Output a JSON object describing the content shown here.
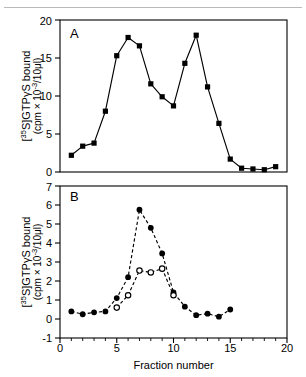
{
  "figure": {
    "panel_a_letter": "A",
    "panel_b_letter": "B",
    "x_axis_label": "Fraction number",
    "y_axis_label_line1": "[35S]GTPγS bound",
    "y_axis_label_line2": "(cpm × 10-3/10μl)",
    "y_axis_label_main": "[",
    "y_axis_sup_35": "35",
    "y_axis_label_mid": "S]GTPγS bound",
    "y_axis_sub_open": "(cpm × 10",
    "y_axis_sup_neg3": "-3",
    "y_axis_sub_close": "/10μl)"
  },
  "colors": {
    "ink": "#000000",
    "paper": "#ffffff",
    "rule": "#b9b9b9"
  },
  "axes": {
    "x_ticks_major": [
      "0",
      "5",
      "10",
      "15",
      "20"
    ],
    "panel_a_y_ticks": [
      "0",
      "5",
      "10",
      "15",
      "20"
    ],
    "panel_b_y_ticks": [
      "-1",
      "0",
      "1",
      "2",
      "3",
      "4",
      "5",
      "6",
      "7"
    ]
  },
  "chart_data": [
    {
      "type": "line",
      "panel": "A",
      "title": "A",
      "xlabel": "",
      "ylabel": "[35S]GTPγS bound (cpm × 10-3/10μl)",
      "xlim": [
        0,
        20
      ],
      "ylim": [
        0,
        20
      ],
      "xticks": [
        0,
        5,
        10,
        15,
        20
      ],
      "yticks": [
        0,
        5,
        10,
        15,
        20
      ],
      "minor_xticks": [
        1,
        2,
        3,
        4,
        6,
        7,
        8,
        9,
        11,
        12,
        13,
        14,
        16,
        17,
        18,
        19
      ],
      "grid": false,
      "legend": "none",
      "series": [
        {
          "name": "[35S]GTPγS bound",
          "marker": "filled-square",
          "linestyle": "solid",
          "x": [
            1,
            2,
            3,
            4,
            5,
            6,
            7,
            8,
            9,
            10,
            11,
            12,
            13,
            14,
            15,
            16,
            17,
            18,
            19
          ],
          "values": [
            2.2,
            3.4,
            3.8,
            8.0,
            15.3,
            17.7,
            16.6,
            11.6,
            9.9,
            8.7,
            14.3,
            18.0,
            11.2,
            6.4,
            1.7,
            0.5,
            0.4,
            0.3,
            0.7
          ]
        }
      ]
    },
    {
      "type": "line",
      "panel": "B",
      "title": "B",
      "xlabel": "Fraction number",
      "ylabel": "[35S]GTPγS bound (cpm × 10-3/10μl)",
      "xlim": [
        0,
        20
      ],
      "ylim": [
        -1,
        7
      ],
      "xticks": [
        0,
        5,
        10,
        15,
        20
      ],
      "yticks": [
        -1,
        0,
        1,
        2,
        3,
        4,
        5,
        6,
        7
      ],
      "minor_xticks": [
        1,
        2,
        3,
        4,
        6,
        7,
        8,
        9,
        11,
        12,
        13,
        14,
        16,
        17,
        18,
        19
      ],
      "grid": false,
      "legend": "none",
      "series": [
        {
          "name": "filled-circle series",
          "marker": "filled-circle",
          "linestyle": "dashed",
          "x": [
            1,
            2,
            3,
            4,
            5,
            6,
            7,
            8,
            9,
            10,
            11,
            12,
            13,
            14,
            15
          ],
          "values": [
            0.4,
            0.25,
            0.35,
            0.4,
            1.1,
            2.2,
            5.75,
            4.8,
            3.45,
            1.4,
            0.65,
            0.2,
            0.28,
            0.12,
            0.5
          ]
        },
        {
          "name": "open-circle series",
          "marker": "open-circle",
          "linestyle": "dashed",
          "x": [
            5,
            6,
            7,
            8,
            9,
            10
          ],
          "values": [
            0.6,
            1.25,
            2.55,
            2.45,
            2.65,
            1.25
          ]
        }
      ]
    }
  ]
}
